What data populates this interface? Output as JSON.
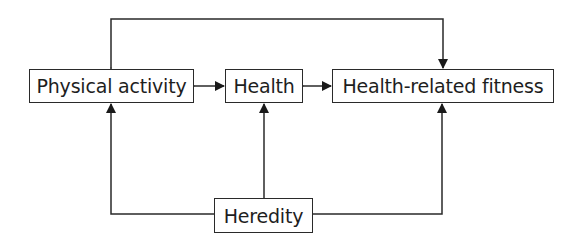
{
  "diagram": {
    "type": "flow-diagram",
    "nodes": [
      {
        "id": "physical_activity",
        "label": "Physical activity"
      },
      {
        "id": "health",
        "label": "Health"
      },
      {
        "id": "health_related_fitness",
        "label": "Health-related fitness"
      },
      {
        "id": "heredity",
        "label": "Heredity"
      }
    ],
    "edges": [
      {
        "from": "physical_activity",
        "to": "health",
        "direction": "bidirectional"
      },
      {
        "from": "health",
        "to": "health_related_fitness",
        "direction": "bidirectional"
      },
      {
        "from": "physical_activity",
        "to": "health_related_fitness",
        "direction": "bidirectional",
        "route": "over-top"
      },
      {
        "from": "heredity",
        "to": "physical_activity",
        "direction": "forward"
      },
      {
        "from": "heredity",
        "to": "health",
        "direction": "forward"
      },
      {
        "from": "heredity",
        "to": "health_related_fitness",
        "direction": "forward"
      }
    ],
    "colors": {
      "line": "#2a2a2a",
      "text": "#1e1e1e",
      "background": "#ffffff"
    }
  }
}
